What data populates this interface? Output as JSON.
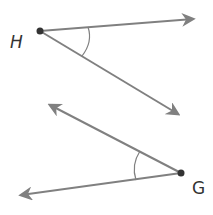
{
  "diagram": {
    "angles": [
      {
        "vertex_label": "H",
        "vertex": [
          40,
          31
        ],
        "ray1_end": [
          195,
          19
        ],
        "ray2_end": [
          180,
          116
        ]
      },
      {
        "vertex_label": "G",
        "vertex": [
          181,
          173
        ],
        "ray1_end": [
          48,
          104
        ],
        "ray2_end": [
          19,
          196
        ]
      }
    ],
    "colors": {
      "line": "#808080",
      "point": "#333333",
      "label": "#333333"
    }
  }
}
